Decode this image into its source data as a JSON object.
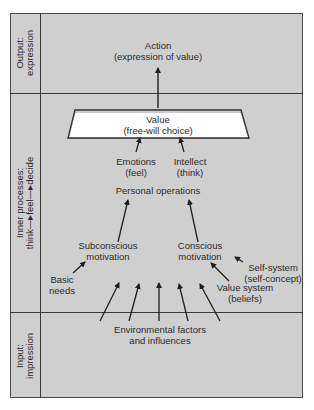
{
  "sections": {
    "output": {
      "title": "Output:",
      "subtitle": "expression"
    },
    "inner": {
      "title": "Inner processes:",
      "subtitle": "think—▸feel—▸decide"
    },
    "input": {
      "title": "Input:",
      "subtitle": "impression"
    }
  },
  "nodes": {
    "action": {
      "line1": "Action",
      "line2": "(expression of value)"
    },
    "value": {
      "line1": "Value",
      "line2": "(free-will choice)"
    },
    "emotions": {
      "line1": "Emotions",
      "line2": "(feel)"
    },
    "intellect": {
      "line1": "Intellect",
      "line2": "(think)"
    },
    "personal_operations": {
      "line1": "Personal operations"
    },
    "subconscious": {
      "line1": "Subconscious",
      "line2": "motivation"
    },
    "conscious": {
      "line1": "Conscious",
      "line2": "motivation"
    },
    "basic_needs": {
      "line1": "Basic",
      "line2": "needs"
    },
    "self_system": {
      "line1": "Self-system",
      "line2": "(self-concept)"
    },
    "value_system": {
      "line1": "Value system",
      "line2": "(beliefs)"
    },
    "environmental": {
      "line1": "Environmental factors",
      "line2": "and influences"
    }
  },
  "colors": {
    "panel": "#cfcfcf",
    "value_box": "#ffffff",
    "lines": "#2a2a2a"
  }
}
